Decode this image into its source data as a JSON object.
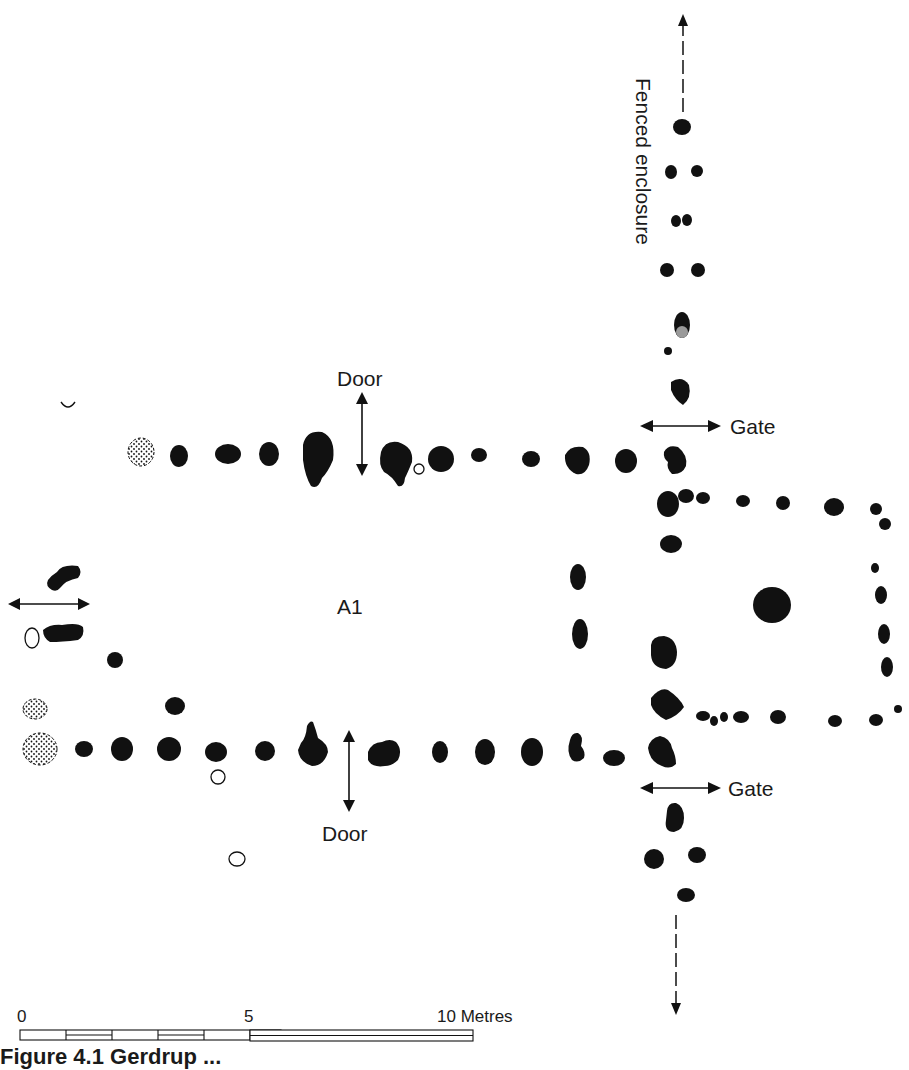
{
  "labels": {
    "fenced_enclosure": "Fenced enclosure",
    "door_top": "Door",
    "door_bottom": "Door",
    "gate_top": "Gate",
    "gate_bottom": "Gate",
    "building": "A1"
  },
  "scale_bar": {
    "tick_0": "0",
    "tick_5": "5",
    "tick_10": "10 Metres"
  },
  "caption": "Figure 4.1  Gerdrup ...",
  "legend_symbols": [
    "posthole-filled",
    "posthole-empty-circle",
    "posthole-stippled",
    "posthole-grey-fill"
  ],
  "colors": {
    "ink": "#111111",
    "grey_fill": "#9a9a9a",
    "background": "#ffffff"
  }
}
